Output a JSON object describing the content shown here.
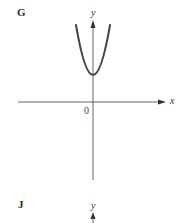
{
  "panels": [
    {
      "label": "G",
      "x_axis_label": "x",
      "y_axis_label": "y",
      "origin_label": "0",
      "curve": "upward parabola with vertex above origin on y-axis"
    },
    {
      "label": "J",
      "y_axis_label": "y"
    }
  ],
  "colors": {
    "axis": "#555555",
    "curve": "#444444",
    "text": "#333333"
  }
}
